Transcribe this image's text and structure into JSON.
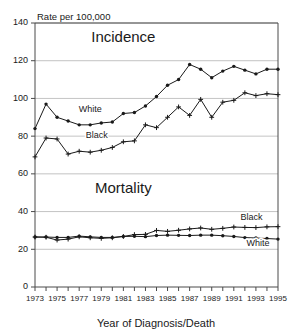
{
  "chart_data": {
    "type": "line",
    "title": "",
    "ylabel": "Rate per 100,000",
    "xlabel": "Year of Diagnosis/Death",
    "ylim": [
      0,
      140
    ],
    "xlim": [
      1973,
      1995
    ],
    "yticks": [
      0,
      20,
      40,
      60,
      80,
      100,
      120,
      140
    ],
    "xticks": [
      1973,
      1974,
      1975,
      1976,
      1977,
      1978,
      1979,
      1980,
      1981,
      1982,
      1983,
      1984,
      1985,
      1986,
      1987,
      1988,
      1989,
      1990,
      1991,
      1992,
      1993,
      1994,
      1995
    ],
    "xtick_labels": [
      "1973",
      "",
      "1975",
      "",
      "1977",
      "",
      "1979",
      "",
      "1981",
      "",
      "1983",
      "",
      "1985",
      "",
      "1987",
      "",
      "1989",
      "",
      "1991",
      "",
      "1993",
      "",
      "1995"
    ],
    "grid": true,
    "legend_position": "inline-annotations",
    "x": [
      1973,
      1974,
      1975,
      1976,
      1977,
      1978,
      1979,
      1980,
      1981,
      1982,
      1983,
      1984,
      1985,
      1986,
      1987,
      1988,
      1989,
      1990,
      1991,
      1992,
      1993,
      1994,
      1995
    ],
    "annotations": [
      {
        "text": "Incidence",
        "x": 1981,
        "y": 130
      },
      {
        "text": "Mortality",
        "x": 1981,
        "y": 50
      }
    ],
    "series": [
      {
        "name": "White Incidence",
        "group": "Incidence",
        "race": "White",
        "marker": "circle",
        "label": "White",
        "label_x": 1978,
        "label_y": 93,
        "values": [
          84,
          97,
          90,
          88,
          86,
          86,
          87,
          87.5,
          92,
          92.5,
          96,
          101,
          107,
          110,
          118,
          115.5,
          111,
          114.5,
          117,
          115,
          113,
          115.5,
          115.5
        ]
      },
      {
        "name": "Black Incidence",
        "group": "Incidence",
        "race": "Black",
        "marker": "plus",
        "label": "Black",
        "label_x": 1978.6,
        "label_y": 79,
        "values": [
          69,
          79,
          78.5,
          70.5,
          72,
          71.5,
          72.5,
          74,
          77,
          77.5,
          86,
          84.5,
          90,
          95.5,
          91,
          99.5,
          90,
          98,
          99,
          103,
          101.5,
          102.5,
          102
        ]
      },
      {
        "name": "White Mortality",
        "group": "Mortality",
        "race": "White",
        "marker": "circle",
        "label": "White",
        "label_x": 1993.2,
        "label_y": 21.5,
        "values": [
          26.5,
          26.5,
          26.3,
          26.3,
          27,
          26.6,
          26.3,
          26.3,
          26.8,
          26.9,
          26.7,
          27.3,
          27.5,
          27.4,
          27.3,
          27.5,
          27.5,
          27.2,
          26.8,
          26.2,
          26,
          25.7,
          25.4
        ]
      },
      {
        "name": "Black Mortality",
        "group": "Mortality",
        "race": "Black",
        "marker": "plus",
        "label": "Black",
        "label_x": 1992.6,
        "label_y": 35.5,
        "values": [
          26.5,
          26.4,
          24.9,
          25.4,
          26.6,
          26.1,
          25.8,
          26.1,
          26.8,
          27.8,
          27.9,
          30,
          29.5,
          30.1,
          30.8,
          31.3,
          30.6,
          31.1,
          31.8,
          31.6,
          31.5,
          31.9,
          32
        ]
      }
    ]
  }
}
